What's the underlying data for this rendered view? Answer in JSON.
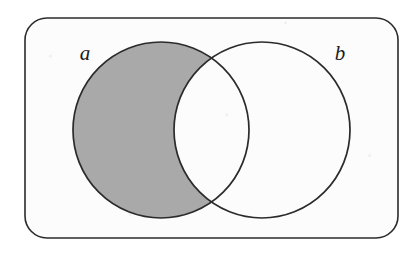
{
  "figure": {
    "type": "venn-diagram",
    "set_count": 2,
    "shaded_region_description": "a-minus-b",
    "background_color": "#fcfcfc",
    "page_color": "#ffffff",
    "stroke_color": "#2b2b2b",
    "shade_color": "#a9a9a9"
  },
  "universe": {
    "name": "universe-rectangle",
    "x": 25,
    "y": 18,
    "width": 373,
    "height": 220,
    "corner_radius": 22,
    "stroke_width": 1.6,
    "fill": "#fcfcfc"
  },
  "sets": [
    {
      "id": "a",
      "label": "a",
      "cx": 161,
      "cy": 130,
      "r": 88,
      "filled": true,
      "fill": "#a9a9a9",
      "label_x": 85,
      "label_y": 60
    },
    {
      "id": "b",
      "label": "b",
      "cx": 262,
      "cy": 130,
      "r": 88,
      "filled": false,
      "fill": "none",
      "label_x": 340,
      "label_y": 60
    }
  ],
  "intersections": [
    {
      "name": "upper-intersection-point",
      "x": 213,
      "y": 52
    },
    {
      "name": "lower-intersection-point",
      "x": 213,
      "y": 209
    }
  ]
}
